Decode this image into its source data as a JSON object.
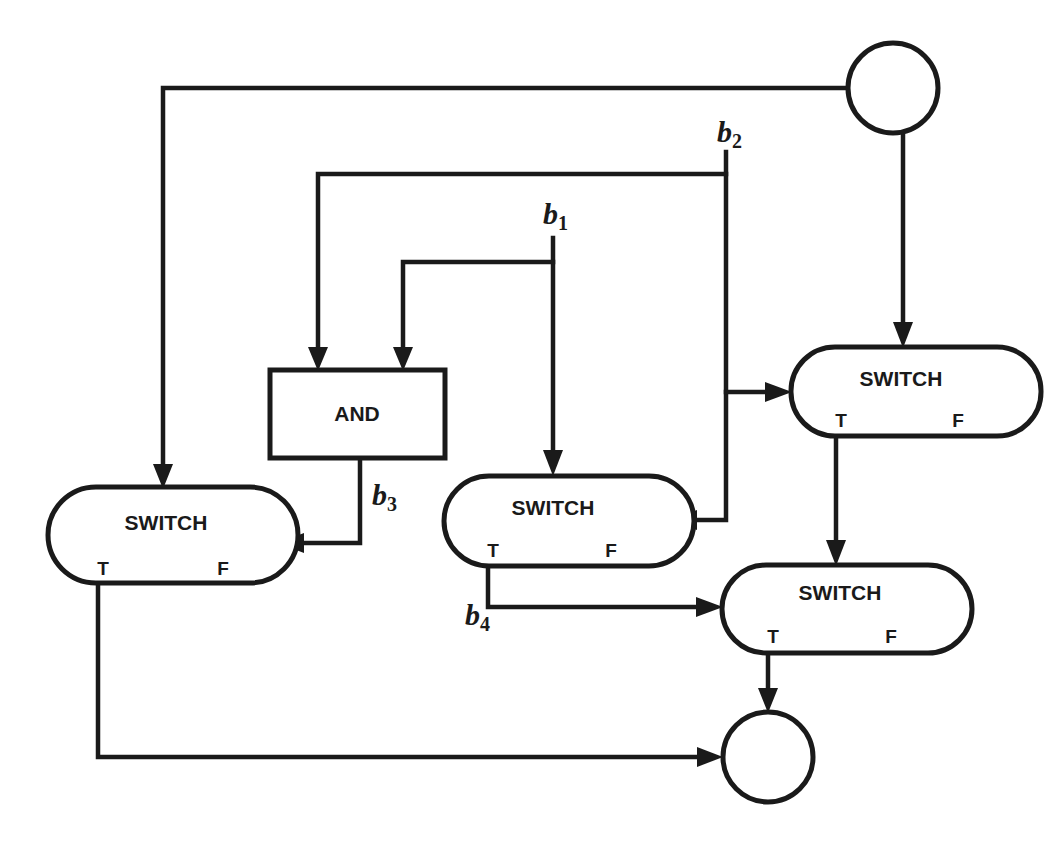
{
  "diagram": {
    "type": "dataflow-graph",
    "nodes": {
      "source": {
        "kind": "circle",
        "label": ""
      },
      "sink": {
        "kind": "circle",
        "label": ""
      },
      "and_gate": {
        "kind": "box",
        "label": "AND"
      },
      "switch_left": {
        "kind": "switch",
        "label": "SWITCH",
        "true_port": "T",
        "false_port": "F"
      },
      "switch_middle": {
        "kind": "switch",
        "label": "SWITCH",
        "true_port": "T",
        "false_port": "F"
      },
      "switch_right_top": {
        "kind": "switch",
        "label": "SWITCH",
        "true_port": "T",
        "false_port": "F"
      },
      "switch_right_bottom": {
        "kind": "switch",
        "label": "SWITCH",
        "true_port": "T",
        "false_port": "F"
      }
    },
    "signals": {
      "b1": {
        "base": "b",
        "sub": "1"
      },
      "b2": {
        "base": "b",
        "sub": "2"
      },
      "b3": {
        "base": "b",
        "sub": "3"
      },
      "b4": {
        "base": "b",
        "sub": "4"
      }
    },
    "edges": [
      {
        "from": "source",
        "to": "switch_left",
        "port": "data"
      },
      {
        "from": "source",
        "to": "switch_right_top",
        "port": "data"
      },
      {
        "from": "b2",
        "to": "and_gate"
      },
      {
        "from": "b2",
        "to": "switch_right_top",
        "port": "control"
      },
      {
        "from": "b2",
        "to": "switch_middle",
        "port": "control"
      },
      {
        "from": "b1",
        "to": "and_gate"
      },
      {
        "from": "b1",
        "to": "switch_middle",
        "port": "data"
      },
      {
        "from": "and_gate",
        "to": "switch_left",
        "port": "control",
        "signal": "b3"
      },
      {
        "from": "switch_middle",
        "from_port": "T",
        "to": "switch_right_bottom",
        "port": "control",
        "signal": "b4"
      },
      {
        "from": "switch_right_top",
        "from_port": "T",
        "to": "switch_right_bottom",
        "port": "data"
      },
      {
        "from": "switch_right_bottom",
        "from_port": "T",
        "to": "sink"
      },
      {
        "from": "switch_left",
        "from_port": "T",
        "to": "sink"
      }
    ]
  }
}
